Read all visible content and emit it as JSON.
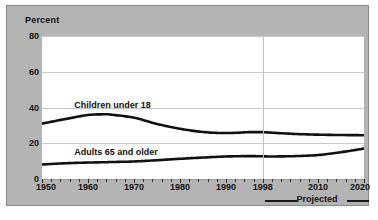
{
  "figure": {
    "y_axis_caption": "Percent",
    "plate_color": "#b4b4b4",
    "plot_background": "#ffffff",
    "gridline_color": "#c9c9c9",
    "series_color": "#111111"
  },
  "legend": {
    "projected_label": "Projected"
  },
  "annotations": {
    "children_label": "Children under 18",
    "adults_label": "Adults 65 and older"
  },
  "chart_data": {
    "type": "line",
    "title": "",
    "subtitle": "",
    "xlabel": "",
    "ylabel": "Percent",
    "xlim": [
      1950,
      2020
    ],
    "ylim": [
      0,
      80
    ],
    "grid": true,
    "legend_position": "bottom-right",
    "y_ticks": [
      0,
      20,
      40,
      60,
      80
    ],
    "y_tick_labels": [
      "0",
      "20",
      "40",
      "60",
      "80"
    ],
    "x_ticks": [
      1950,
      1960,
      1970,
      1980,
      1990,
      1998,
      2010,
      2020
    ],
    "x_tick_labels": [
      "1950",
      "1960",
      "1970",
      "1980",
      "1990",
      "1998",
      "2010",
      "2020"
    ],
    "x_minor_tick_step": 2,
    "projection_start_year": 1998,
    "annotations": [
      {
        "text": "Children under 18",
        "x": 1957,
        "y": 44
      },
      {
        "text": "Adults 65 and older",
        "x": 1957,
        "y": 18
      },
      {
        "text": "Projected",
        "x": 2009,
        "y": -9
      }
    ],
    "series": [
      {
        "name": "Children under 18",
        "x": [
          1950,
          1955,
          1960,
          1964,
          1965,
          1970,
          1975,
          1980,
          1985,
          1990,
          1995,
          1998,
          2000,
          2005,
          2010,
          2015,
          2020
        ],
        "values": [
          31.0,
          33.5,
          35.8,
          36.2,
          36.0,
          34.3,
          30.8,
          28.1,
          26.3,
          25.7,
          26.2,
          26.2,
          25.9,
          25.2,
          24.8,
          24.6,
          24.5
        ]
      },
      {
        "name": "Adults 65 and older",
        "x": [
          1950,
          1955,
          1960,
          1964,
          1965,
          1970,
          1975,
          1980,
          1985,
          1990,
          1995,
          1998,
          2000,
          2005,
          2010,
          2015,
          2020
        ],
        "values": [
          8.1,
          8.8,
          9.2,
          9.4,
          9.5,
          9.8,
          10.5,
          11.3,
          12.0,
          12.6,
          12.8,
          12.7,
          12.6,
          12.8,
          13.4,
          15.0,
          17.0
        ]
      }
    ]
  }
}
